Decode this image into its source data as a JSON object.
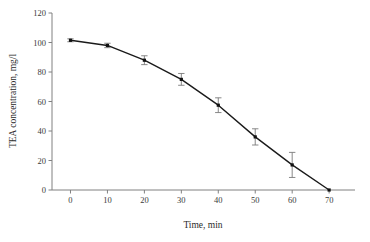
{
  "chart_data": {
    "type": "line",
    "title": "",
    "subtitle": "",
    "xlabel": "Time, min",
    "ylabel": "TEA concentration, mg/l",
    "x": [
      0,
      10,
      20,
      30,
      40,
      50,
      60,
      70
    ],
    "values": [
      101.5,
      98.0,
      88.0,
      75.0,
      57.5,
      36.0,
      17.0,
      0.0
    ],
    "error": [
      1.0,
      1.5,
      3.0,
      4.0,
      5.0,
      5.5,
      8.5,
      0.0
    ],
    "series": [
      {
        "name": "TEA concentration",
        "values": [
          101.5,
          98.0,
          88.0,
          75.0,
          57.5,
          36.0,
          17.0,
          0.0
        ],
        "error": [
          1.0,
          1.5,
          3.0,
          4.0,
          5.0,
          5.5,
          8.5,
          0.0
        ]
      }
    ],
    "xlim": [
      -5,
      77
    ],
    "ylim": [
      0,
      120
    ],
    "xticks": [
      0,
      10,
      20,
      30,
      40,
      50,
      60,
      70
    ],
    "yticks": [
      0,
      20,
      40,
      60,
      80,
      100,
      120
    ],
    "xtick_labels": [
      "0",
      "10",
      "20",
      "30",
      "40",
      "50",
      "60",
      "70"
    ],
    "ytick_labels": [
      "0",
      "20",
      "40",
      "60",
      "80",
      "100",
      "120"
    ],
    "grid": false,
    "legend": false,
    "legend_position": "none",
    "marker": "square",
    "line_color": "#1a1a1a",
    "marker_color": "#111111",
    "axis_color": "#808080",
    "error_bar_color": "#7a7a7a",
    "background_color": "#ffffff"
  }
}
